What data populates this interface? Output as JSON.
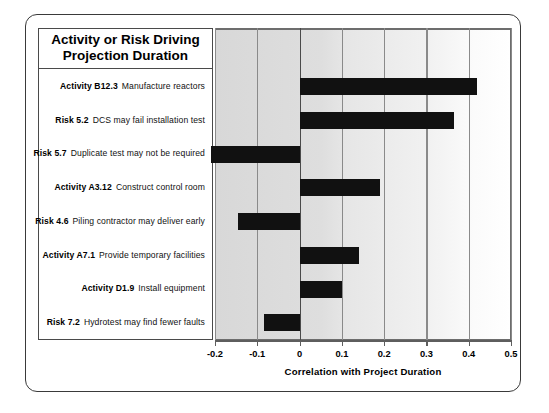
{
  "header": {
    "title_line1": "Activity or Risk Driving",
    "title_line2": "Projection Duration"
  },
  "axis": {
    "title": "Correlation with Project Duration",
    "ticks": [
      "-0.2",
      "-0.1",
      "0",
      "0.1",
      "0.2",
      "0.3",
      "0.4",
      "0.5"
    ]
  },
  "rows": [
    {
      "id": "Activity B12.3",
      "desc": "Manufacture reactors"
    },
    {
      "id": "Risk 5.2",
      "desc": "DCS may fail installation test"
    },
    {
      "id": "Risk 5.7",
      "desc": "Duplicate test may not be required"
    },
    {
      "id": "Activity A3.12",
      "desc": "Construct control room"
    },
    {
      "id": "Risk 4.6",
      "desc": "Piling contractor may deliver early"
    },
    {
      "id": "Activity A7.1",
      "desc": "Provide temporary facilities"
    },
    {
      "id": "Activity D1.9",
      "desc": "Install equipment"
    },
    {
      "id": "Risk 7.2",
      "desc": "Hydrotest may find fewer faults"
    }
  ],
  "colors": {
    "bar": "#111111",
    "frame": "#3a3a3a",
    "grid": "#8a8a8a",
    "plot_band_left": "#d8d8d8",
    "plot_band_right": "#ffffff"
  },
  "chart_data": {
    "type": "bar",
    "orientation": "horizontal",
    "title": "Activity or Risk Driving Projection Duration",
    "xlabel": "Correlation with Project Duration",
    "ylabel": "",
    "xlim": [
      -0.2,
      0.5
    ],
    "xticks": [
      -0.2,
      -0.1,
      0,
      0.1,
      0.2,
      0.3,
      0.4,
      0.5
    ],
    "grid": true,
    "legend": "none",
    "categories": [
      "Activity B12.3 Manufacture reactors",
      "Risk 5.2 DCS may fail installation test",
      "Risk 5.7 Duplicate test may not be required",
      "Activity A3.12 Construct control room",
      "Risk 4.6 Piling contractor may deliver early",
      "Activity A7.1 Provide temporary facilities",
      "Activity D1.9 Install equipment",
      "Risk 7.2 Hydrotest may find fewer faults"
    ],
    "values": [
      0.42,
      0.365,
      -0.21,
      0.19,
      -0.145,
      0.14,
      0.1,
      -0.085
    ]
  }
}
